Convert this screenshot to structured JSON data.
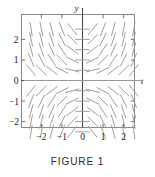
{
  "figure": {
    "caption": "FIGURE 1",
    "axis_labels": {
      "horizontal": "t",
      "vertical": "y"
    },
    "colors": {
      "frame": "#8a8a8a",
      "axis": "#4a4a4a",
      "segment": "#9a9a9a",
      "text": "#1a1a1a",
      "caption": "#2b2b2b",
      "background": "#ffffff"
    }
  },
  "chart_data": {
    "type": "scatter",
    "plot_kind": "direction-field",
    "title": "FIGURE 1",
    "xlabel": "t",
    "ylabel": "y",
    "equation": "y' = t*y",
    "grid": false,
    "legend": null,
    "xlim": [
      -2.75,
      2.75
    ],
    "ylim": [
      -2.75,
      2.75
    ],
    "xticks": [
      -2,
      -1,
      0,
      1,
      2
    ],
    "xtick_labels": [
      "−2",
      "−1",
      "0",
      "1",
      "2"
    ],
    "yticks": [
      -2,
      -1,
      0,
      1,
      2
    ],
    "ytick_labels": [
      "−2",
      "−1",
      "0",
      "1",
      "2"
    ],
    "sample_points_x": [
      -2.5,
      -2.0,
      -1.5,
      -1.0,
      -0.5,
      0.0,
      0.5,
      1.0,
      1.5,
      2.0,
      2.5
    ],
    "sample_points_y": [
      -2.5,
      -2.0,
      -1.5,
      -1.0,
      -0.5,
      0.0,
      0.5,
      1.0,
      1.5,
      2.0,
      2.5
    ],
    "slope_formula_note": "slope at (t,y) equals t times y; positive in quadrants I and III, negative in quadrants II and IV, zero along both axes",
    "segment_length": 0.34,
    "axes_drawn": [
      "x-axis at y=0",
      "y-axis at t=0"
    ],
    "frame": "full rectangular box border"
  }
}
